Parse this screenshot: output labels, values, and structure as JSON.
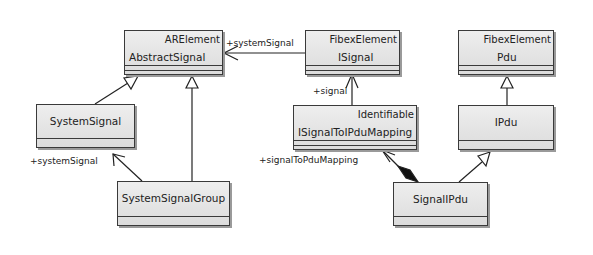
{
  "classes": {
    "abstract_signal": {
      "stereotype": "ARElement",
      "name": "AbstractSignal"
    },
    "isignal": {
      "stereotype": "FibexElement",
      "name": "ISignal"
    },
    "pdu": {
      "stereotype": "FibexElement",
      "name": "Pdu"
    },
    "system_signal": {
      "name": "SystemSignal"
    },
    "isignal_to_pdu_mapping": {
      "stereotype": "Identifiable",
      "name": "ISignalToIPduMapping"
    },
    "ipdu": {
      "name": "IPdu"
    },
    "system_signal_group": {
      "name": "SystemSignalGroup"
    },
    "signal_ipdu": {
      "name": "SignalIPdu"
    }
  },
  "labels": {
    "isignal_system_signal": "+systemSignal",
    "mapping_signal": "+signal",
    "group_system_signal": "+systemSignal",
    "signal_to_pdu_mapping": "+signalToPduMapping"
  }
}
